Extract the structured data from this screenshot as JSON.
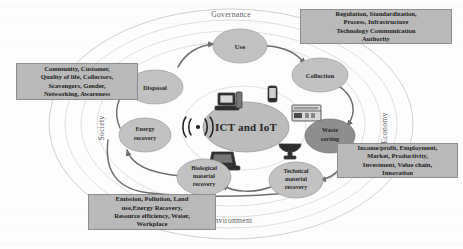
{
  "figure": {
    "core_label": "ICT and IoT",
    "wifi_icon": "wireless-signal-icon"
  },
  "pillars": [
    {
      "key": "governance",
      "label": "Governance"
    },
    {
      "key": "economy",
      "label": "Economy"
    },
    {
      "key": "environment",
      "label": "Environment"
    },
    {
      "key": "society",
      "label": "Society"
    }
  ],
  "cycle_nodes": [
    {
      "key": "use",
      "label": "Use",
      "lines": [
        "Use"
      ],
      "shade": "light"
    },
    {
      "key": "collection",
      "label": "Collection",
      "lines": [
        "Collection"
      ],
      "shade": "light"
    },
    {
      "key": "waste-sorting",
      "label": "Waste sorting",
      "lines": [
        "Waste",
        "sorting"
      ],
      "shade": "dark"
    },
    {
      "key": "technical-material-recovery",
      "label": "Technical material recovery",
      "lines": [
        "Technical",
        "material",
        "recovery"
      ],
      "shade": "light"
    },
    {
      "key": "biological-material-recovery",
      "label": "Biological material recovery",
      "lines": [
        "Biological",
        "material",
        "recovery"
      ],
      "shade": "light"
    },
    {
      "key": "energy-recovery",
      "label": "Energy recovery",
      "lines": [
        "Energy",
        "recovery"
      ],
      "shade": "light"
    },
    {
      "key": "disposal",
      "label": "Disposal",
      "lines": [
        "Disposal"
      ],
      "shade": "light"
    }
  ],
  "callouts": {
    "governance": {
      "title": "Governance factors",
      "lines": [
        "Regulation, Standardization,",
        "Process, Infrastructure",
        "Technology Communication",
        "Authority"
      ]
    },
    "society": {
      "title": "Society factors",
      "lines": [
        "Community, Customer,",
        "Quality of life, Collectors,",
        "Scavengers, Gender,",
        "Networking, Awareness"
      ]
    },
    "economy": {
      "title": "Economy factors",
      "lines": [
        "Income/profit, Employment,",
        "Market, Productivity,",
        "Investment, Value chain,",
        "Innovation"
      ]
    },
    "environment": {
      "title": "Environment factors",
      "lines": [
        "Emission, Pollution, Land",
        "use,Energy Recovery,",
        "Resource efficiency, Water,",
        "Workplace"
      ]
    }
  },
  "device_icons": [
    {
      "key": "desktop-computer",
      "name": "desktop-computer-icon"
    },
    {
      "key": "mobile-phone",
      "name": "mobile-phone-icon"
    },
    {
      "key": "server-rack",
      "name": "server-rack-icon"
    },
    {
      "key": "satellite-dish",
      "name": "satellite-dish-icon"
    },
    {
      "key": "laptop",
      "name": "laptop-icon"
    }
  ],
  "colors": {
    "node_light": "#c2c2c2",
    "node_dark": "#8e8e8e",
    "callout_bg": "#b9b9b9",
    "ring_stroke": "#c8c8c8",
    "flow_stroke": "#6e6e6e",
    "text": "#1c1c1c"
  }
}
